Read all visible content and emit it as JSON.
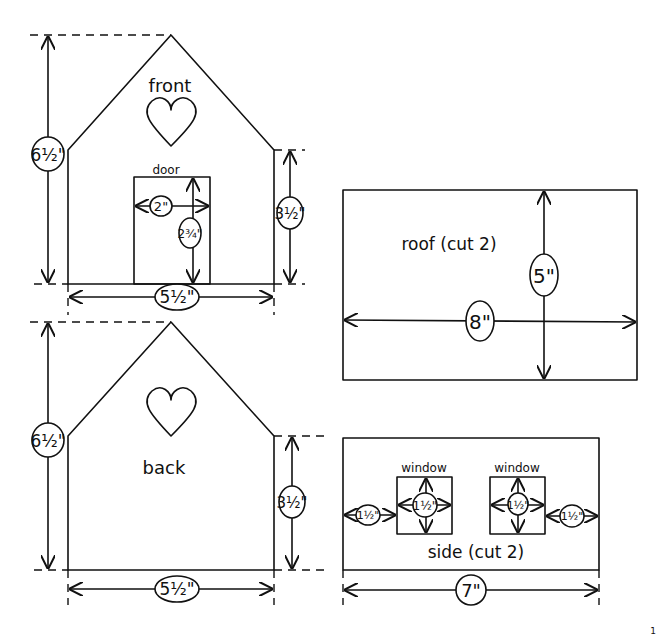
{
  "pieces": {
    "front": {
      "label": "front",
      "height": "6½\"",
      "wall_height": "3½\"",
      "width": "5½\"",
      "door": {
        "label": "door",
        "width": "2\"",
        "height": "2¾\""
      }
    },
    "back": {
      "label": "back",
      "height": "6½\"",
      "wall_height": "3½\"",
      "width": "5½\""
    },
    "roof": {
      "label": "roof (cut 2)",
      "width": "8\"",
      "height": "5\""
    },
    "side": {
      "label": "side (cut 2)",
      "width": "7\"",
      "window_left": {
        "label": "window",
        "size": "1½\""
      },
      "window_right": {
        "label": "window",
        "size": "1½\""
      },
      "left_margin": "1½\"",
      "right_margin": "1½\""
    }
  },
  "page_number": "1"
}
